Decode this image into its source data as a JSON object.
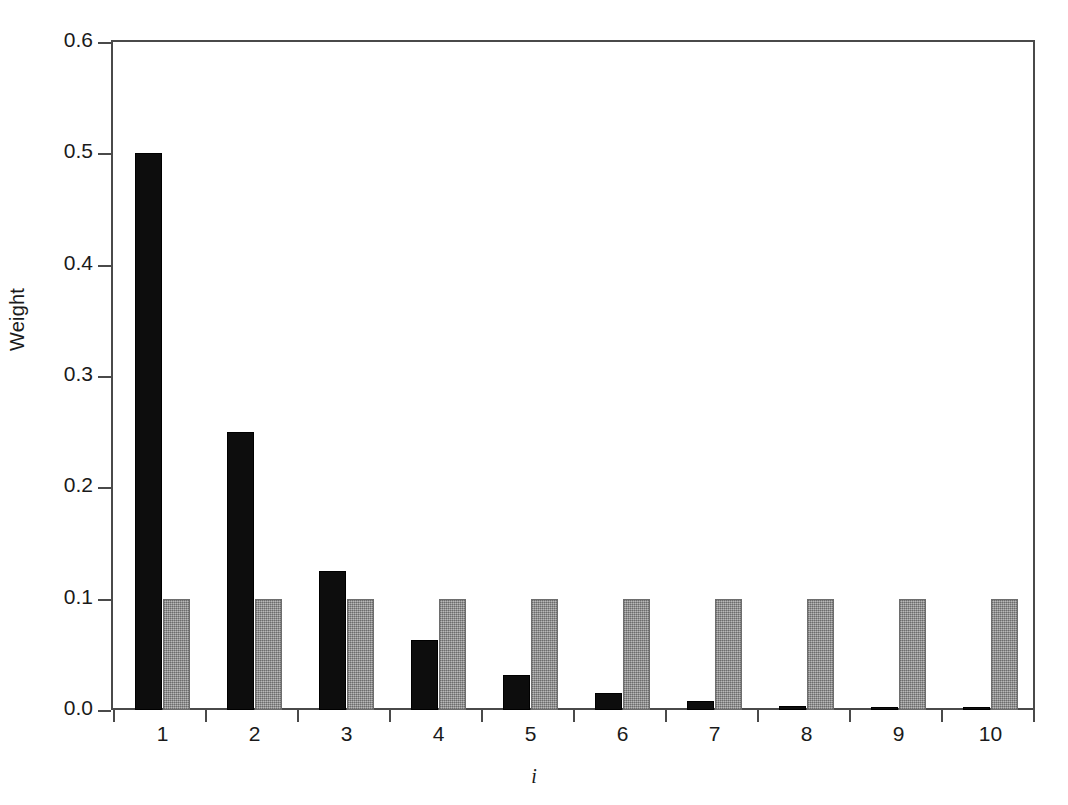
{
  "chart_data": {
    "type": "bar",
    "title": "",
    "subtitle": "",
    "xlabel": "i",
    "ylabel": "Weight",
    "categories": [
      "1",
      "2",
      "3",
      "4",
      "5",
      "6",
      "7",
      "8",
      "9",
      "10"
    ],
    "series": [
      {
        "name": "geometric-weights",
        "color": "#0d0d0d",
        "values": [
          0.5,
          0.25,
          0.125,
          0.0625,
          0.03125,
          0.015625,
          0.0078125,
          0.00390625,
          0.001953125,
          0.0009765625
        ]
      },
      {
        "name": "uniform-weights",
        "color": "#9a9a9a",
        "values": [
          0.1,
          0.1,
          0.1,
          0.1,
          0.1,
          0.1,
          0.1,
          0.1,
          0.1,
          0.1
        ]
      }
    ],
    "ylim": [
      0.0,
      0.6
    ],
    "yticks": [
      "0.0",
      "0.1",
      "0.2",
      "0.3",
      "0.4",
      "0.5",
      "0.6"
    ],
    "ytick_values": [
      0.0,
      0.1,
      0.2,
      0.3,
      0.4,
      0.5,
      0.6
    ],
    "grid": false,
    "legend": "none",
    "legend_position": "none",
    "annotations": []
  },
  "axes": {
    "y_title": "Weight",
    "x_title": "i",
    "frame_color": "#4a4a4a"
  }
}
